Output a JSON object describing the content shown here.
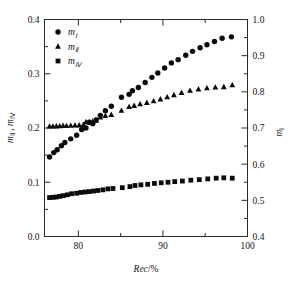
{
  "chart_data": {
    "type": "scatter",
    "title": "",
    "subtitle": "",
    "xlabel": "Rec/%",
    "ylabel_left": "mⅡ , mⅣ",
    "ylabel_right": "mⅠ",
    "xlim": [
      76,
      100
    ],
    "ylim_left": [
      0.0,
      0.4
    ],
    "ylim_right": [
      0.4,
      1.0
    ],
    "xticks": [
      80,
      90,
      100
    ],
    "xticklabels": [
      "80",
      "90",
      "100"
    ],
    "xminorticks": [
      85,
      95
    ],
    "yticks_left": [
      0.0,
      0.1,
      0.2,
      0.3,
      0.4
    ],
    "yticklabels_left": [
      "0.0",
      "0.1",
      "0.2",
      "0.3",
      "0.4"
    ],
    "yminorticks_left": [
      0.05,
      0.15,
      0.25,
      0.35
    ],
    "yticks_right": [
      0.4,
      0.5,
      0.6,
      0.7,
      0.8,
      0.9,
      1.0
    ],
    "yticklabels_right": [
      "0.4",
      "0.5",
      "0.6",
      "0.7",
      "0.8",
      "0.9",
      "1.0"
    ],
    "yminorticks_right": [
      0.45,
      0.55,
      0.65,
      0.75,
      0.85,
      0.95
    ],
    "grid": false,
    "legend_position": "upper-left",
    "marker_color": "#0b0b0b",
    "series": [
      {
        "name": "mⅠ",
        "marker": "circle",
        "axis": "right",
        "legend_label_base": "m",
        "legend_label_sub": "Ⅰ",
        "points": [
          [
            76.6,
            0.62
          ],
          [
            77.1,
            0.632
          ],
          [
            77.5,
            0.64
          ],
          [
            78.0,
            0.651
          ],
          [
            78.4,
            0.66
          ],
          [
            79.1,
            0.67
          ],
          [
            79.8,
            0.68
          ],
          [
            80.4,
            0.696
          ],
          [
            80.9,
            0.7
          ],
          [
            81.3,
            0.716
          ],
          [
            81.7,
            0.712
          ],
          [
            82.1,
            0.722
          ],
          [
            82.6,
            0.735
          ],
          [
            83.2,
            0.748
          ],
          [
            83.9,
            0.76
          ],
          [
            85.1,
            0.785
          ],
          [
            86.0,
            0.793
          ],
          [
            86.4,
            0.803
          ],
          [
            87.1,
            0.812
          ],
          [
            87.9,
            0.826
          ],
          [
            88.7,
            0.84
          ],
          [
            89.4,
            0.852
          ],
          [
            90.2,
            0.866
          ],
          [
            91.0,
            0.88
          ],
          [
            91.8,
            0.889
          ],
          [
            92.7,
            0.901
          ],
          [
            93.5,
            0.912
          ],
          [
            94.4,
            0.922
          ],
          [
            95.2,
            0.93
          ],
          [
            96.1,
            0.939
          ],
          [
            97.0,
            0.948
          ],
          [
            98.1,
            0.952
          ]
        ]
      },
      {
        "name": "mⅡ",
        "marker": "triangle",
        "axis": "left",
        "legend_label_base": "m",
        "legend_label_sub": "Ⅱ",
        "points": [
          [
            76.6,
            0.203
          ],
          [
            77.0,
            0.203
          ],
          [
            77.4,
            0.2032
          ],
          [
            77.8,
            0.2035
          ],
          [
            78.2,
            0.2042
          ],
          [
            78.6,
            0.204
          ],
          [
            79.1,
            0.2044
          ],
          [
            79.6,
            0.2048
          ],
          [
            80.1,
            0.2052
          ],
          [
            80.6,
            0.206
          ],
          [
            80.9,
            0.211
          ],
          [
            81.3,
            0.2105
          ],
          [
            81.7,
            0.212
          ],
          [
            82.1,
            0.214
          ],
          [
            82.6,
            0.22
          ],
          [
            83.2,
            0.2225
          ],
          [
            83.9,
            0.2245
          ],
          [
            85.1,
            0.232
          ],
          [
            86.0,
            0.239
          ],
          [
            86.6,
            0.241
          ],
          [
            87.3,
            0.244
          ],
          [
            88.1,
            0.2465
          ],
          [
            88.9,
            0.2495
          ],
          [
            89.7,
            0.253
          ],
          [
            90.5,
            0.257
          ],
          [
            91.3,
            0.261
          ],
          [
            92.2,
            0.265
          ],
          [
            93.2,
            0.269
          ],
          [
            94.2,
            0.2715
          ],
          [
            95.2,
            0.2735
          ],
          [
            96.2,
            0.275
          ],
          [
            97.2,
            0.2755
          ],
          [
            98.2,
            0.279
          ]
        ]
      },
      {
        "name": "mⅣ",
        "marker": "square",
        "axis": "left",
        "legend_label_base": "m",
        "legend_label_sub": "Ⅳ",
        "points": [
          [
            76.6,
            0.0718
          ],
          [
            77.0,
            0.0722
          ],
          [
            77.4,
            0.0728
          ],
          [
            77.8,
            0.074
          ],
          [
            78.2,
            0.0752
          ],
          [
            78.7,
            0.0768
          ],
          [
            79.2,
            0.0788
          ],
          [
            79.8,
            0.0798
          ],
          [
            80.3,
            0.0812
          ],
          [
            80.8,
            0.082
          ],
          [
            81.3,
            0.0828
          ],
          [
            81.8,
            0.0838
          ],
          [
            82.3,
            0.0848
          ],
          [
            82.9,
            0.086
          ],
          [
            83.5,
            0.0878
          ],
          [
            84.1,
            0.0885
          ],
          [
            85.2,
            0.09
          ],
          [
            86.1,
            0.092
          ],
          [
            86.7,
            0.094
          ],
          [
            87.4,
            0.0952
          ],
          [
            88.2,
            0.0962
          ],
          [
            89.0,
            0.0978
          ],
          [
            89.8,
            0.099
          ],
          [
            90.6,
            0.1
          ],
          [
            91.4,
            0.1012
          ],
          [
            92.3,
            0.1022
          ],
          [
            93.3,
            0.1038
          ],
          [
            94.3,
            0.1048
          ],
          [
            95.3,
            0.1062
          ],
          [
            96.3,
            0.1075
          ],
          [
            97.2,
            0.1082
          ],
          [
            98.2,
            0.1075
          ]
        ]
      }
    ]
  },
  "legend": {
    "entries": [
      {
        "marker": "circle",
        "base": "m",
        "sub": "Ⅰ"
      },
      {
        "marker": "triangle",
        "base": "m",
        "sub": "Ⅱ"
      },
      {
        "marker": "square",
        "base": "m",
        "sub": "Ⅳ"
      }
    ]
  },
  "axes": {
    "x_title_italic": "Rec",
    "x_title_rest": "/%",
    "left_title_m1": "m",
    "left_title_sub1": "Ⅱ",
    "left_title_comma": " , ",
    "left_title_m2": "m",
    "left_title_sub2": "Ⅳ",
    "right_title_m": "m",
    "right_title_sub": "Ⅰ"
  }
}
